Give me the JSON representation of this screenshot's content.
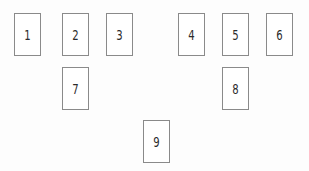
{
  "diagram": {
    "background_color": "#fdfdfd",
    "box_fill_color": "#ffffff",
    "box_border_color": "#8a8a8a",
    "label_color": "#2b2b2b",
    "box_width": 27,
    "box_height": 43,
    "nodes": [
      {
        "id": "node-1",
        "label": "1",
        "x": 14,
        "y": 13,
        "row": 1
      },
      {
        "id": "node-2",
        "label": "2",
        "x": 62,
        "y": 13,
        "row": 1
      },
      {
        "id": "node-3",
        "label": "3",
        "x": 106,
        "y": 13,
        "row": 1
      },
      {
        "id": "node-4",
        "label": "4",
        "x": 178,
        "y": 13,
        "row": 1
      },
      {
        "id": "node-5",
        "label": "5",
        "x": 222,
        "y": 13,
        "row": 1
      },
      {
        "id": "node-6",
        "label": "6",
        "x": 266,
        "y": 13,
        "row": 1
      },
      {
        "id": "node-7",
        "label": "7",
        "x": 62,
        "y": 67,
        "row": 2
      },
      {
        "id": "node-8",
        "label": "8",
        "x": 222,
        "y": 67,
        "row": 2
      },
      {
        "id": "node-9",
        "label": "9",
        "x": 143,
        "y": 120,
        "row": 3
      }
    ]
  }
}
